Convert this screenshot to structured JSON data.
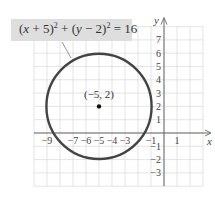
{
  "chart_data": {
    "type": "scatter",
    "title": "",
    "equation": "(x + 5)^2 + (y - 2)^2 = 16",
    "equation_parts": {
      "x_var": "x",
      "x_op": " + 5)",
      "y_var": "y",
      "y_op": " − 2)",
      "exp": "2",
      "rhs": " = 16"
    },
    "shape": "circle",
    "center": {
      "x": -5,
      "y": 2,
      "label": "(−5, 2)"
    },
    "radius": 4,
    "xlabel": "x",
    "ylabel": "y",
    "xlim": [
      -10,
      3
    ],
    "ylim": [
      -4,
      8
    ],
    "x_ticks": [
      {
        "value": -9,
        "label": "−9"
      },
      {
        "value": -7,
        "label": "−7"
      },
      {
        "value": -6,
        "label": "−6"
      },
      {
        "value": -5,
        "label": "−5"
      },
      {
        "value": -4,
        "label": "−4"
      },
      {
        "value": -3,
        "label": "−3"
      },
      {
        "value": -1,
        "label": "−1"
      },
      {
        "value": 1,
        "label": "1"
      }
    ],
    "y_ticks": [
      {
        "value": 7,
        "label": "7"
      },
      {
        "value": 6,
        "label": "6"
      },
      {
        "value": 5,
        "label": "5"
      },
      {
        "value": 4,
        "label": "4"
      },
      {
        "value": 3,
        "label": "3"
      },
      {
        "value": 2,
        "label": "2"
      },
      {
        "value": 1,
        "label": "1"
      },
      {
        "value": -1,
        "label": "−1"
      },
      {
        "value": -2,
        "label": "−2"
      },
      {
        "value": -3,
        "label": "−3"
      }
    ],
    "grid": true,
    "legend": "none",
    "colors": {
      "circle": "#444444",
      "grid": "#d9d9d9",
      "axis": "#666666",
      "label_box": "#dedede"
    }
  }
}
